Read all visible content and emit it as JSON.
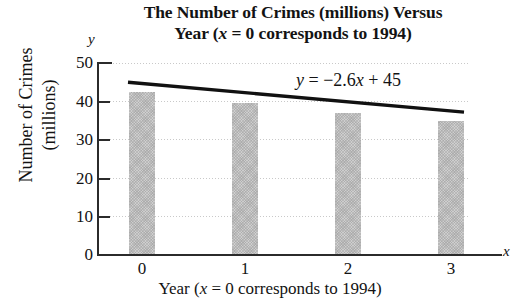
{
  "chart_data": {
    "type": "bar",
    "title": "The Number of Crimes (millions) Versus Year (x = 0 corresponds to 1994)",
    "title_lines": [
      "The Number of Crimes (millions) Versus",
      "Year (x = 0 corresponds to 1994)"
    ],
    "xlabel": "Year (x = 0 corresponds to 1994)",
    "ylabel": "Number of Crimes (millions)",
    "ylabel_lines": [
      "Number of Crimes",
      "(millions)"
    ],
    "x_axis_letter": "x",
    "y_axis_letter": "y",
    "categories": [
      "0",
      "1",
      "2",
      "3"
    ],
    "values": [
      42.5,
      39.6,
      37.0,
      35.0
    ],
    "xlim": [
      -0.5,
      3.6
    ],
    "ylim": [
      0,
      50
    ],
    "yticks": [
      0,
      10,
      20,
      30,
      40,
      50
    ],
    "ytick_labels": [
      "0",
      "10",
      "20",
      "30",
      "40",
      "50"
    ],
    "xtick_labels": [
      "0",
      "1",
      "2",
      "3"
    ],
    "grid": true,
    "legend": "none",
    "bar_color": "#b9b9b9",
    "line_color": "#111111",
    "annotations": [
      {
        "text": "y = −2.6x + 45",
        "type": "equation",
        "slope": -2.6,
        "intercept": 45
      }
    ],
    "trend_line": {
      "equation": "y = -2.6x + 45",
      "slope": -2.6,
      "intercept": 45,
      "endpoints": [
        {
          "x": 0,
          "y": 45
        },
        {
          "x": 3,
          "y": 37.2
        }
      ]
    }
  },
  "equation_parts": {
    "y": "y",
    "eq": "=",
    "rhs_num": "−2.6",
    "rhs_var": "x",
    "plus": "+",
    "constant": "45"
  },
  "title_parts": {
    "line1": "The Number of Crimes (millions) Versus",
    "line2_pre": "Year (",
    "line2_var": "x",
    "line2_post": " = 0 corresponds to 1994)"
  },
  "xlabel_parts": {
    "pre": "Year (",
    "var": "x",
    "post": " = 0 corresponds to 1994)"
  }
}
